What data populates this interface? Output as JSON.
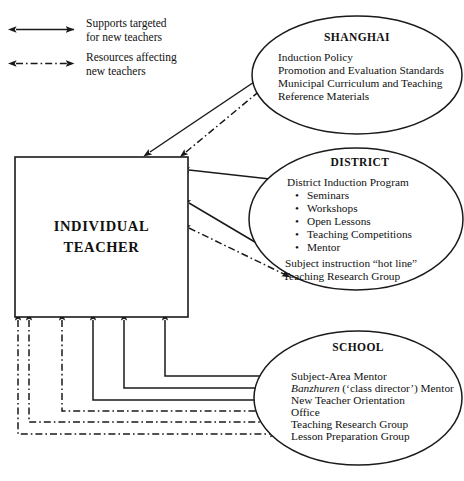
{
  "figure": {
    "type": "diagram",
    "kind": "ecological-support-map",
    "bottom_caption": ""
  },
  "legend": {
    "items": [
      {
        "id": "solid",
        "style": "solid-double-arrow",
        "line1": "Supports targeted",
        "line2": "for new teachers"
      },
      {
        "id": "dashdot",
        "style": "dash-dot-double-arrow",
        "line1": "Resources affecting",
        "line2": "new teachers"
      }
    ]
  },
  "center": {
    "line1": "INDIVIDUAL",
    "line2": "TEACHER"
  },
  "nodes": {
    "shanghai": {
      "title": "SHANGHAI",
      "lines": [
        "Induction Policy",
        "Promotion and Evaluation Standards",
        "Municipal Curriculum and Teaching",
        "Reference Materials"
      ]
    },
    "district": {
      "title": "DISTRICT",
      "lines": [
        "District Induction Program",
        "Subject instruction “hot line”",
        "Teaching Research Group"
      ],
      "bullets": [
        "Seminars",
        "Workshops",
        "Open Lessons",
        "Teaching Competitions",
        "Mentor"
      ],
      "bullet_glyph": "•"
    },
    "school": {
      "title": "SCHOOL",
      "lines": [
        "Subject-Area Mentor",
        "New Teacher Orientation",
        "Office",
        "Teaching Research Group",
        "Lesson Preparation Group"
      ],
      "banzhuren_italic": "Banzhuren",
      "banzhuren_rest": " (‘class director’) Mentor"
    }
  },
  "colors": {
    "ink": "#1a1a1a",
    "background": "#ffffff"
  }
}
